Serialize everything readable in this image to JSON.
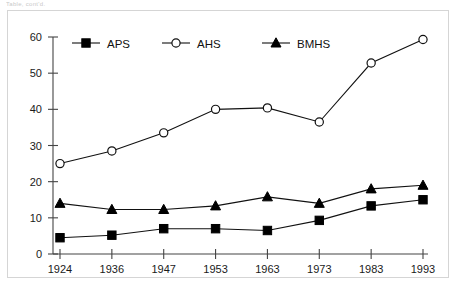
{
  "page": {
    "caption_faint": "Table, cont'd."
  },
  "chart_data": {
    "type": "line",
    "title": "",
    "subtitle": "",
    "xlabel": "",
    "ylabel": "",
    "categories": [
      "1924",
      "1936",
      "1947",
      "1953",
      "1963",
      "1973",
      "1983",
      "1993"
    ],
    "x": [
      1924,
      1936,
      1947,
      1953,
      1963,
      1973,
      1983,
      1993
    ],
    "series": [
      {
        "name": "APS",
        "marker": "filled-square",
        "values": [
          4.5,
          5.2,
          7.0,
          7.0,
          6.5,
          9.3,
          13.3,
          15.0
        ]
      },
      {
        "name": "AHS",
        "marker": "open-circle",
        "values": [
          25.0,
          28.5,
          33.5,
          40.0,
          40.4,
          36.5,
          52.8,
          59.3
        ]
      },
      {
        "name": "BMHS",
        "marker": "filled-triangle",
        "values": [
          14.0,
          12.3,
          12.3,
          13.3,
          15.8,
          14.0,
          18.0,
          19.0
        ]
      }
    ],
    "ylim": [
      0,
      60
    ],
    "yticks": [
      0,
      10,
      20,
      30,
      40,
      50,
      60
    ],
    "ytick_labels": [
      "0",
      "10",
      "20",
      "30",
      "40",
      "50",
      "60"
    ],
    "xtick_labels": [
      "1924",
      "1936",
      "1947",
      "1953",
      "1963",
      "1973",
      "1983",
      "1993"
    ],
    "grid": false,
    "legend_position": "top-inside",
    "legend_entries": [
      "APS",
      "AHS",
      "BMHS"
    ],
    "colors": {
      "line": "#111111",
      "axis": "#444444",
      "marker_fill": "#000000",
      "open_marker_fill": "#ffffff",
      "frame": "#d5d5d5",
      "background": "#ffffff"
    }
  }
}
